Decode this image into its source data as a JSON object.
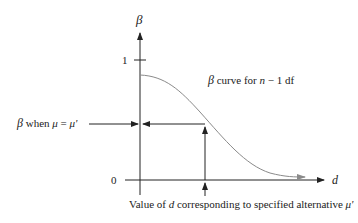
{
  "diagram": {
    "y_axis_label": "β",
    "x_axis_label": "d",
    "tick_one": "1",
    "tick_zero": "0",
    "curve_label_beta": "β",
    "curve_label_rest_1": " curve for ",
    "curve_label_n": "n",
    "curve_label_rest_2": " − 1 df",
    "left_label_beta": "β",
    "left_label_when": " when ",
    "left_label_mu": "μ",
    "left_label_eq": " = ",
    "left_label_mu_prime": "μ'",
    "bottom_label_prefix": "Value of ",
    "bottom_label_d": "d",
    "bottom_label_suffix": " corresponding to specified alternative ",
    "bottom_label_mu_prime": "μ'",
    "colors": {
      "axis": "#222222",
      "curve": "#8a8a8a"
    }
  }
}
